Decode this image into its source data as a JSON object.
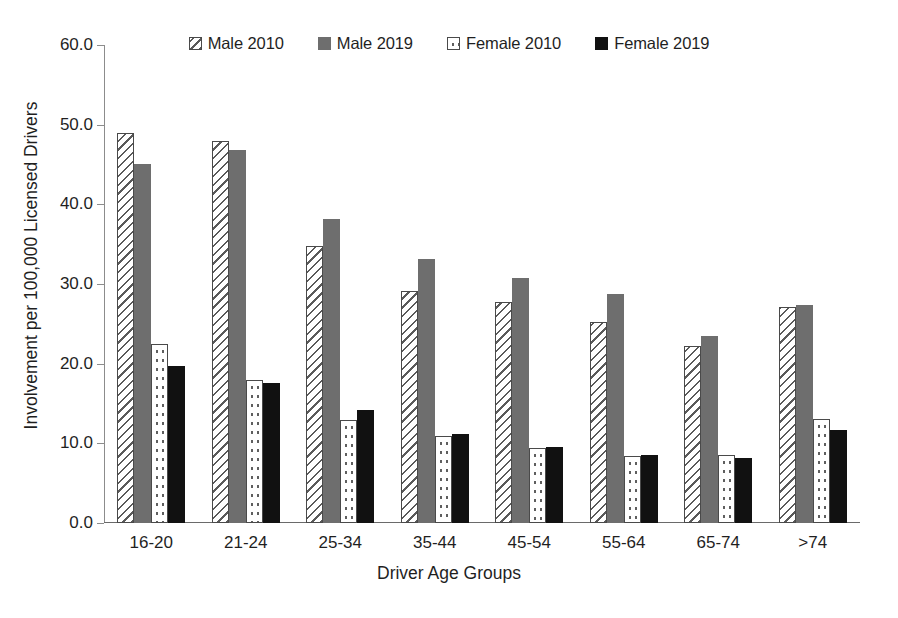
{
  "chart_data": {
    "type": "bar",
    "title": "",
    "xlabel": "Driver Age Groups",
    "ylabel": "Involvement per 100,000 Licensed Drivers",
    "categories": [
      "16-20",
      "21-24",
      "25-34",
      "35-44",
      "45-54",
      "55-64",
      "65-74",
      ">74"
    ],
    "series": [
      {
        "name": "Male 2010",
        "pattern": "diagonal-hatch",
        "color": "#ffffff",
        "values": [
          49.0,
          48.0,
          34.8,
          29.1,
          27.8,
          25.2,
          22.2,
          27.1
        ]
      },
      {
        "name": "Male 2019",
        "pattern": "solid-gray",
        "color": "#6e6e6e",
        "values": [
          45.1,
          46.8,
          38.2,
          33.2,
          30.8,
          28.8,
          23.5,
          27.4
        ]
      },
      {
        "name": "Female 2010",
        "pattern": "dotted",
        "color": "#ffffff",
        "values": [
          22.5,
          18.0,
          12.9,
          10.9,
          9.4,
          8.4,
          8.5,
          13.0
        ]
      },
      {
        "name": "Female 2019",
        "pattern": "solid-black",
        "color": "#111111",
        "values": [
          19.7,
          17.6,
          14.2,
          11.2,
          9.6,
          8.5,
          8.2,
          11.7
        ]
      }
    ],
    "ylim": [
      0.0,
      60.0
    ],
    "ytick_labels": [
      "60.0",
      "50.0",
      "40.0",
      "30.0",
      "20.0",
      "10.0",
      "0.0"
    ],
    "ytick_values": [
      60.0,
      50.0,
      40.0,
      30.0,
      20.0,
      10.0,
      0.0
    ],
    "grid": false,
    "legend_position": "top-center"
  }
}
